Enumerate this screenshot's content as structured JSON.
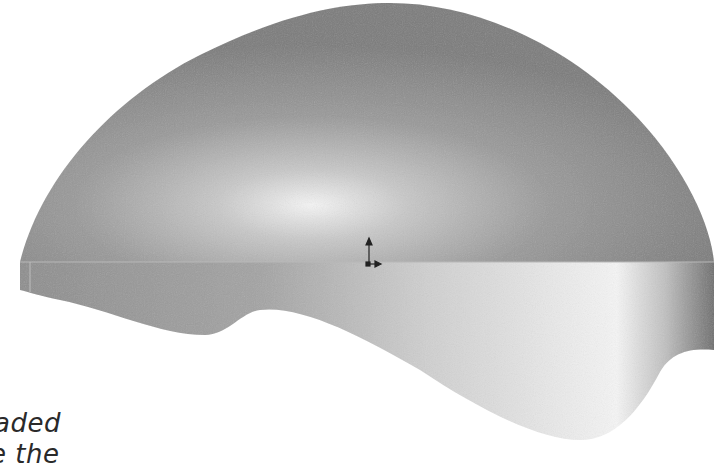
{
  "figure": {
    "colors": {
      "base_gray": "#8a8a8a",
      "dark_gray": "#6e6e6e",
      "highlight": "#f2f2f2",
      "background": "#ffffff"
    },
    "triad_icon": "coordinate-axes-icon"
  },
  "caption": {
    "line1": "aded",
    "line2": "e the"
  }
}
